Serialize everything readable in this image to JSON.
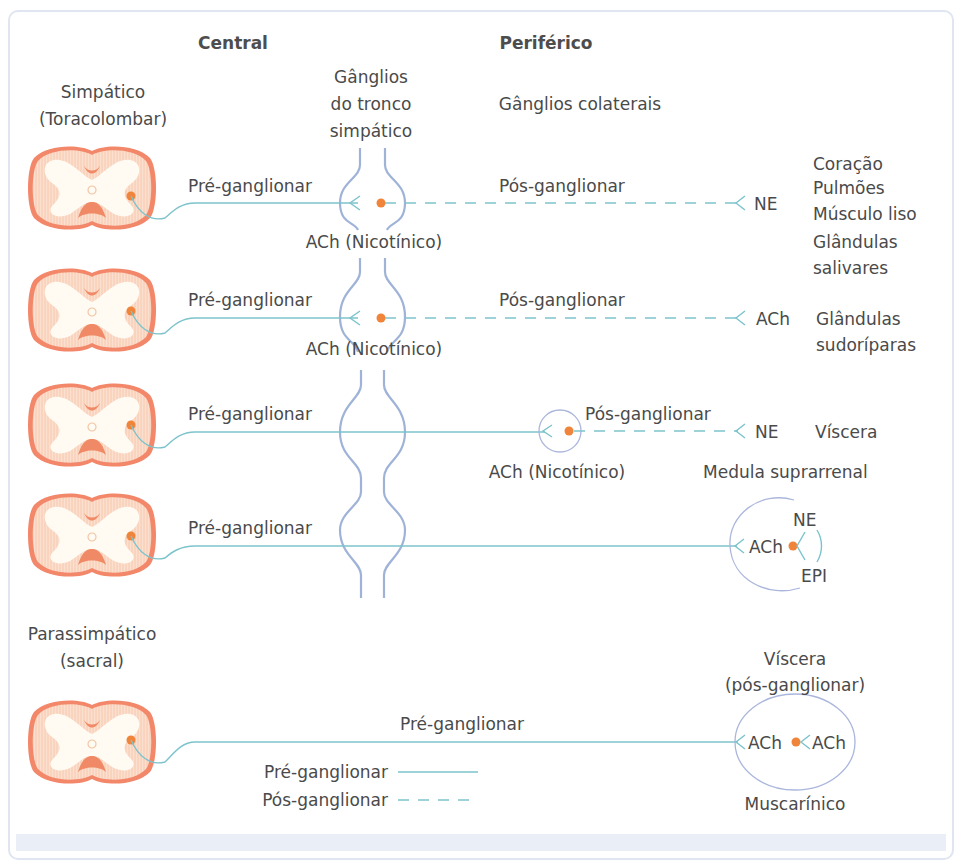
{
  "headers": {
    "central": "Central",
    "peripheral": "Periférico"
  },
  "sympathetic": {
    "title_line1": "Simpático",
    "title_line2": "(Toracolombar)",
    "trunk_ganglia": [
      "Gânglios",
      "do tronco",
      "simpático"
    ],
    "collateral_ganglia": "Gânglios colaterais",
    "rows": [
      {
        "pre_label": "Pré-ganglionar",
        "post_label": "Pós-ganglionar",
        "receptor": "ACh (Nicotínico)",
        "transmitter": "NE",
        "targets": [
          "Coração",
          "Pulmões",
          "Músculo liso",
          "Glândulas",
          "salivares"
        ]
      },
      {
        "pre_label": "Pré-ganglionar",
        "post_label": "Pós-ganglionar",
        "receptor": "ACh (Nicotínico)",
        "transmitter": "ACh",
        "targets": [
          "Glândulas",
          "sudoríparas"
        ]
      },
      {
        "pre_label": "Pré-ganglionar",
        "post_label": "Pós-ganglionar",
        "receptor": "ACh (Nicotínico)",
        "transmitter": "NE",
        "targets": [
          "Víscera"
        ]
      },
      {
        "pre_label": "Pré-ganglionar",
        "target_title": "Medula suprarrenal",
        "transmitter": "ACh",
        "outputs": [
          "NE",
          "EPI"
        ]
      }
    ]
  },
  "parasympathetic": {
    "title_line1": "Parassimpático",
    "title_line2": "(sacral)",
    "pre_label": "Pré-ganglionar",
    "target_line1": "Víscera",
    "target_line2": "(pós-ganglionar)",
    "transmitter_pre": "ACh",
    "transmitter_post": "ACh",
    "receptor": "Muscarínico"
  },
  "legend": {
    "items": [
      {
        "label": "Pré-ganglionar",
        "style": "solid"
      },
      {
        "label": "Pós-ganglionar",
        "style": "dashed"
      }
    ]
  },
  "colors": {
    "nerve_line": "#7cc3cc",
    "ganglion_outline": "#9fb3d8",
    "neuron_dot": "#f0843a",
    "spinal_cord": "#f07a55",
    "text": "#4a4a4a"
  }
}
